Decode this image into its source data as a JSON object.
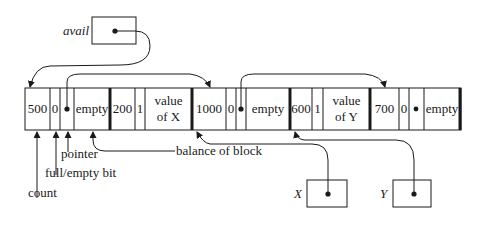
{
  "diagram": {
    "avail_label": "avail",
    "cells": [
      {
        "id": "c1-count",
        "text": "500"
      },
      {
        "id": "c1-bit",
        "text": "0"
      },
      {
        "id": "c1-empty",
        "text": "empty"
      },
      {
        "id": "c2-count",
        "text": "200"
      },
      {
        "id": "c2-bit",
        "text": "1"
      },
      {
        "id": "c2-value-line1",
        "text": "value"
      },
      {
        "id": "c2-value-line2",
        "text": "of X"
      },
      {
        "id": "c3-count",
        "text": "1000"
      },
      {
        "id": "c3-bit",
        "text": "0"
      },
      {
        "id": "c3-empty",
        "text": "empty"
      },
      {
        "id": "c4-count",
        "text": "600"
      },
      {
        "id": "c4-bit",
        "text": "1"
      },
      {
        "id": "c4-value-line1",
        "text": "value"
      },
      {
        "id": "c4-value-line2",
        "text": "of Y"
      },
      {
        "id": "c5-count",
        "text": "700"
      },
      {
        "id": "c5-bit",
        "text": "0"
      },
      {
        "id": "c5-empty",
        "text": "empty"
      }
    ],
    "annotations": {
      "pointer": "pointer",
      "full_empty_bit": "full/empty bit",
      "count": "count",
      "balance_of_block": "balance of block"
    },
    "var_x_label": "X",
    "var_y_label": "Y"
  }
}
